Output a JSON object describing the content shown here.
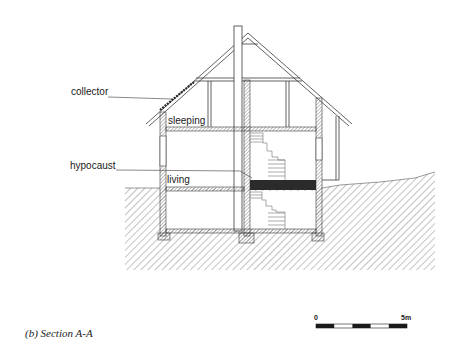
{
  "figure": {
    "caption": "(b) Section A-A",
    "type": "architectural cross-section"
  },
  "labels": {
    "collector": "collector",
    "sleeping": "sleeping",
    "hypocaust": "hypocaust",
    "living": "living"
  },
  "scale_bar": {
    "start_label": "0",
    "end_label": "5m",
    "segments": 5,
    "pattern": [
      "black",
      "white",
      "black",
      "white",
      "black"
    ]
  },
  "colors": {
    "line": "#3a3a3a",
    "hatch": "#6a6a6a",
    "hypocaust_fill": "#2b2b2b",
    "background": "#ffffff"
  }
}
